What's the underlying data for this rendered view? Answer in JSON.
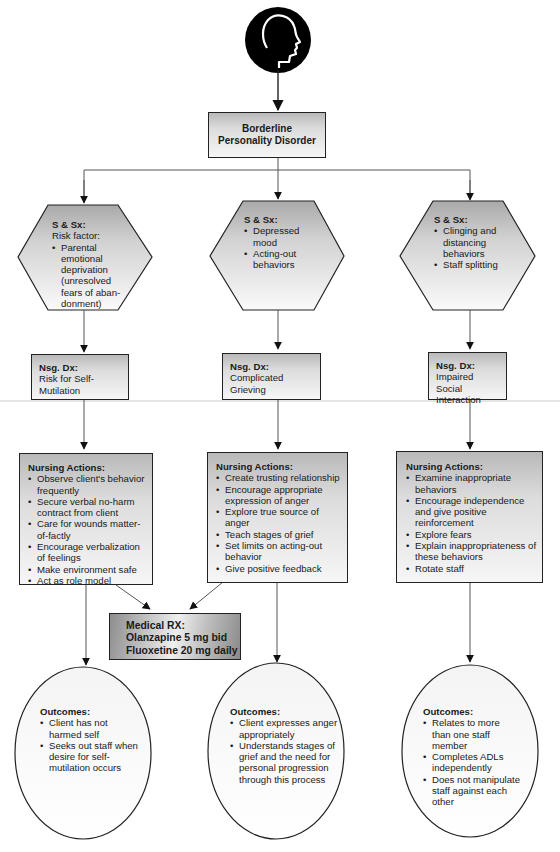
{
  "diagram": {
    "root_icon": "head-profile-icon",
    "title": {
      "line1": "Borderline",
      "line2": "Personality Disorder"
    },
    "columns": [
      {
        "signs_symptoms": {
          "header": "S & Sx:",
          "subheader": "Risk factor:",
          "items": [
            "Parental emotional deprivation (unresolved fears of aban-donment)"
          ]
        },
        "nursing_diagnosis": {
          "header": "Nsg. Dx:",
          "text": "Risk for Self-Mutilation"
        },
        "nursing_actions": {
          "header": "Nursing Actions:",
          "items": [
            "Observe client's behavior frequently",
            "Secure verbal no-harm contract from client",
            "Care for wounds matter-of-factly",
            "Encourage verbalization of feelings",
            "Make environment safe",
            "Act as role model"
          ]
        },
        "outcomes": {
          "header": "Outcomes:",
          "items": [
            "Client has not harmed self",
            "Seeks out staff when desire for self-mutilation occurs"
          ]
        }
      },
      {
        "signs_symptoms": {
          "header": "S & Sx:",
          "items": [
            "Depressed mood",
            "Acting-out behaviors"
          ]
        },
        "nursing_diagnosis": {
          "header": "Nsg. Dx:",
          "text": "Complicated Grieving"
        },
        "nursing_actions": {
          "header": "Nursing Actions:",
          "items": [
            "Create trusting relationship",
            "Encourage appropriate expression of anger",
            "Explore true source of anger",
            "Teach stages of grief",
            "Set limits on acting-out behavior",
            "Give positive feedback"
          ]
        },
        "outcomes": {
          "header": "Outcomes:",
          "items": [
            "Client expresses anger appropriately",
            "Understands stages of grief and the need for personal progression through this process"
          ]
        }
      },
      {
        "signs_symptoms": {
          "header": "S & Sx:",
          "items": [
            "Clinging and distancing behaviors",
            "Staff splitting"
          ]
        },
        "nursing_diagnosis": {
          "header": "Nsg. Dx:",
          "text": "Impaired Social Interaction"
        },
        "nursing_actions": {
          "header": "Nursing Actions:",
          "items": [
            "Examine inappropriate behaviors",
            "Encourage independence and give positive reinforcement",
            "Explore fears",
            "Explain inappropriateness of these behaviors",
            "Rotate staff"
          ]
        },
        "outcomes": {
          "header": "Outcomes:",
          "items": [
            "Relates to more than one staff member",
            "Completes ADLs independently",
            "Does not manipulate staff against each other"
          ]
        }
      }
    ],
    "medical_rx": {
      "header": "Medical RX:",
      "lines": [
        "Olanzapine 5 mg bid",
        "Fluoxetine 20 mg daily"
      ]
    }
  },
  "colors": {
    "line": "#555555",
    "border": "#222222",
    "head_fill": "#000000",
    "shape_gradient_top": "#b9b9b9",
    "shape_gradient_bottom": "#f6f6f6"
  }
}
